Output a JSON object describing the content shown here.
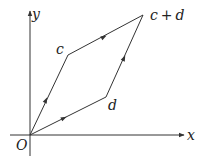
{
  "diagram": {
    "type": "vector-parallelogram",
    "axes": {
      "x_label": "x",
      "y_label": "y",
      "origin_label": "O"
    },
    "points": {
      "origin": {
        "label": "O",
        "x": 30,
        "y": 135
      },
      "c": {
        "label": "c",
        "x": 68,
        "y": 55
      },
      "d": {
        "label": "d",
        "x": 106,
        "y": 97
      },
      "c_plus_d": {
        "label": "c + d",
        "x": 143,
        "y": 15
      }
    },
    "labels": {
      "c": "c",
      "d": "d",
      "c_plus_d_c": "c",
      "plus": "+",
      "c_plus_d_d": "d"
    },
    "colors": {
      "stroke": "#333333",
      "text": "#222222",
      "background": "#ffffff"
    }
  }
}
